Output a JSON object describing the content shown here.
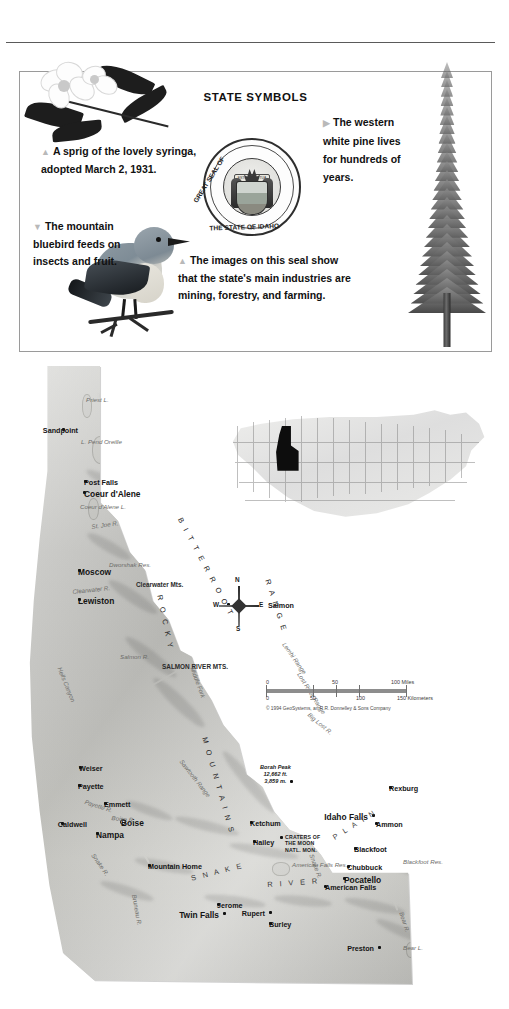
{
  "symbols_panel": {
    "title": "STATE SYMBOLS",
    "captions": {
      "syringa": {
        "marker": "▲",
        "text": "A sprig of the lovely syringa, adopted March 2, 1931."
      },
      "bluebird": {
        "marker": "▼",
        "text": "The mountain bluebird feeds on insects and fruit."
      },
      "seal": {
        "marker": "▲",
        "text": "The images on this seal show that the state's main industries are mining, forestry, and farming."
      },
      "pine": {
        "marker": "▶",
        "text": "The western white pine lives for hundreds of years."
      }
    },
    "seal": {
      "top_text": "GREAT SEAL OF",
      "bottom_text": "THE STATE OF IDAHO",
      "motto": "ESTO PERPETUA",
      "star": "☆"
    }
  },
  "map": {
    "cities": [
      {
        "name": "Sandpoint",
        "x": 38,
        "y": 62,
        "dx": 54,
        "dy": 64,
        "major": false,
        "anchor": "right"
      },
      {
        "name": "Post Falls",
        "x": 60,
        "y": 114,
        "dx": 55,
        "dy": 116,
        "major": false,
        "anchor": "left"
      },
      {
        "name": "Coeur d'Alene",
        "x": 59,
        "y": 125,
        "dx": 55,
        "dy": 127,
        "major": true,
        "anchor": "left"
      },
      {
        "name": "Moscow",
        "x": 54,
        "y": 203,
        "dx": 49,
        "dy": 205,
        "major": true,
        "anchor": "left"
      },
      {
        "name": "Lewiston",
        "x": 54,
        "y": 232,
        "dx": 49,
        "dy": 234,
        "major": true,
        "anchor": "left"
      },
      {
        "name": "Salmon",
        "x": 203,
        "y": 237,
        "dx": 239,
        "dy": 239,
        "major": false,
        "anchor": "left"
      },
      {
        "name": "Weiser",
        "x": 55,
        "y": 400,
        "dx": 50,
        "dy": 402,
        "major": false,
        "anchor": "left"
      },
      {
        "name": "Payette",
        "x": 54,
        "y": 418,
        "dx": 49,
        "dy": 420,
        "major": false,
        "anchor": "left"
      },
      {
        "name": "Emmett",
        "x": 80,
        "y": 436,
        "dx": 75,
        "dy": 438,
        "major": false,
        "anchor": "left"
      },
      {
        "name": "Caldwell",
        "x": 37,
        "y": 456,
        "dx": 63,
        "dy": 458,
        "major": false,
        "anchor": "right"
      },
      {
        "name": "Boise",
        "x": 96,
        "y": 453,
        "dx": 92,
        "dy": 456,
        "major": true,
        "anchor": "left",
        "capital": true
      },
      {
        "name": "Nampa",
        "x": 72,
        "y": 466,
        "dx": 67,
        "dy": 468,
        "major": true,
        "anchor": "left"
      },
      {
        "name": "Ketchum",
        "x": 226,
        "y": 455,
        "dx": 221,
        "dy": 457,
        "major": false,
        "anchor": "left"
      },
      {
        "name": "Hailey",
        "x": 229,
        "y": 474,
        "dx": 224,
        "dy": 476,
        "major": false,
        "anchor": "left"
      },
      {
        "name": "Mountain Home",
        "x": 124,
        "y": 498,
        "dx": 119,
        "dy": 500,
        "major": false,
        "anchor": "left"
      },
      {
        "name": "Jerome",
        "x": 193,
        "y": 537,
        "dx": 188,
        "dy": 539,
        "major": false,
        "anchor": "left"
      },
      {
        "name": "Twin Falls",
        "x": 199,
        "y": 546,
        "dx": 195,
        "dy": 548,
        "major": true,
        "anchor": "right"
      },
      {
        "name": "Rupert",
        "x": 245,
        "y": 545,
        "dx": 241,
        "dy": 547,
        "major": false,
        "anchor": "right"
      },
      {
        "name": "Burley",
        "x": 245,
        "y": 556,
        "dx": 240,
        "dy": 558,
        "major": false,
        "anchor": "left"
      },
      {
        "name": "Rexburg",
        "x": 365,
        "y": 420,
        "dx": 360,
        "dy": 422,
        "major": false,
        "anchor": "left"
      },
      {
        "name": "Idaho Falls",
        "x": 348,
        "y": 448,
        "dx": 344,
        "dy": 450,
        "major": true,
        "anchor": "right"
      },
      {
        "name": "Ammon",
        "x": 351,
        "y": 456,
        "dx": 347,
        "dy": 458,
        "major": false,
        "anchor": "left"
      },
      {
        "name": "Blackfoot",
        "x": 330,
        "y": 481,
        "dx": 325,
        "dy": 483,
        "major": false,
        "anchor": "left"
      },
      {
        "name": "Chubbuck",
        "x": 323,
        "y": 499,
        "dx": 318,
        "dy": 501,
        "major": false,
        "anchor": "left"
      },
      {
        "name": "Pocatello",
        "x": 319,
        "y": 511,
        "dx": 315,
        "dy": 513,
        "major": true,
        "anchor": "left"
      },
      {
        "name": "American Falls",
        "x": 300,
        "y": 519,
        "dx": 296,
        "dy": 521,
        "major": false,
        "anchor": "left"
      },
      {
        "name": "Preston",
        "x": 354,
        "y": 580,
        "dx": 350,
        "dy": 582,
        "major": false,
        "anchor": "right"
      }
    ],
    "ranges": [
      {
        "label": "B I T T E R R O O T",
        "x": 160,
        "y": 150,
        "rot": 62
      },
      {
        "label": "R O C K Y",
        "x": 140,
        "y": 228,
        "rot": 78
      },
      {
        "label": "M O U N T A I N S",
        "x": 185,
        "y": 370,
        "rot": 74
      },
      {
        "label": "R A N G E",
        "x": 248,
        "y": 212,
        "rot": 72
      }
    ],
    "features": [
      {
        "label": "Priest L.",
        "x": 62,
        "y": 30,
        "rot": 0
      },
      {
        "label": "L. Pend Oreille",
        "x": 57,
        "y": 72,
        "rot": 0
      },
      {
        "label": "Coeur d'Alene L.",
        "x": 56,
        "y": 137,
        "rot": 0
      },
      {
        "label": "St. Joe R.",
        "x": 67,
        "y": 157,
        "rot": -8
      },
      {
        "label": "Dworshak Res.",
        "x": 85,
        "y": 195,
        "rot": 0
      },
      {
        "label": "Clearwater R.",
        "x": 48,
        "y": 222,
        "rot": -6
      },
      {
        "label": "Clearwater Mts.",
        "x": 112,
        "y": 215,
        "rot": 0,
        "bold": true
      },
      {
        "label": "Hells Canyon",
        "x": 39,
        "y": 300,
        "rot": 68
      },
      {
        "label": "Salmon R.",
        "x": 96,
        "y": 287,
        "rot": 0
      },
      {
        "label": "SALMON RIVER MTS.",
        "x": 138,
        "y": 297,
        "rot": 0,
        "bold": true
      },
      {
        "label": "Middle Fork",
        "x": 172,
        "y": 300,
        "rot": 70
      },
      {
        "label": "Sawtooth Range",
        "x": 160,
        "y": 392,
        "rot": 52
      },
      {
        "label": "Lemhi Range",
        "x": 263,
        "y": 275,
        "rot": 55
      },
      {
        "label": "Lost River Range",
        "x": 278,
        "y": 305,
        "rot": 58
      },
      {
        "label": "Big Lost R.",
        "x": 287,
        "y": 345,
        "rot": 40
      },
      {
        "label": "Payette R.",
        "x": 62,
        "y": 432,
        "rot": 18
      },
      {
        "label": "Boise R.",
        "x": 88,
        "y": 448,
        "rot": 6
      },
      {
        "label": "Snake R.",
        "x": 72,
        "y": 486,
        "rot": 55
      },
      {
        "label": "Bruneau R.",
        "x": 114,
        "y": 528,
        "rot": 80
      },
      {
        "label": "Snake R.",
        "x": 291,
        "y": 487,
        "rot": 70
      },
      {
        "label": "American Falls Res.",
        "x": 268,
        "y": 495,
        "rot": 0
      },
      {
        "label": "Blackfoot Res.",
        "x": 379,
        "y": 492,
        "rot": 0
      },
      {
        "label": "Bear R.",
        "x": 381,
        "y": 545,
        "rot": 72
      },
      {
        "label": "Bear L.",
        "x": 379,
        "y": 578,
        "rot": 0
      }
    ],
    "plain_label": [
      {
        "label": "S N A K E",
        "x": 166,
        "y": 508,
        "rot": -14
      },
      {
        "label": "R I V E R",
        "x": 243,
        "y": 514,
        "rot": -4
      },
      {
        "label": "P L A I N",
        "x": 307,
        "y": 468,
        "rot": -32
      }
    ],
    "park": {
      "name": "CRATERS OF\nTHE MOON\nNATL. MON.",
      "x": 261,
      "y": 470,
      "dot_x": 256,
      "dot_y": 470
    },
    "peak": {
      "name": "Borah Peak",
      "elev_ft": "12,662 ft.",
      "elev_m": "3,859 m.",
      "x": 236,
      "y": 398,
      "dot_x": 266,
      "dot_y": 414
    },
    "compass": {
      "n": "N",
      "e": "E",
      "s": "S",
      "w": "W"
    },
    "scale": {
      "miles_labels": [
        "0",
        "50",
        "100 Miles"
      ],
      "km_labels": [
        "0",
        "50",
        "100",
        "150 Kilometers"
      ],
      "credit": "© 1994 GeoSystems, an R.R. Donnelley & Sons Company"
    },
    "inset_name": "united-states-locator"
  }
}
